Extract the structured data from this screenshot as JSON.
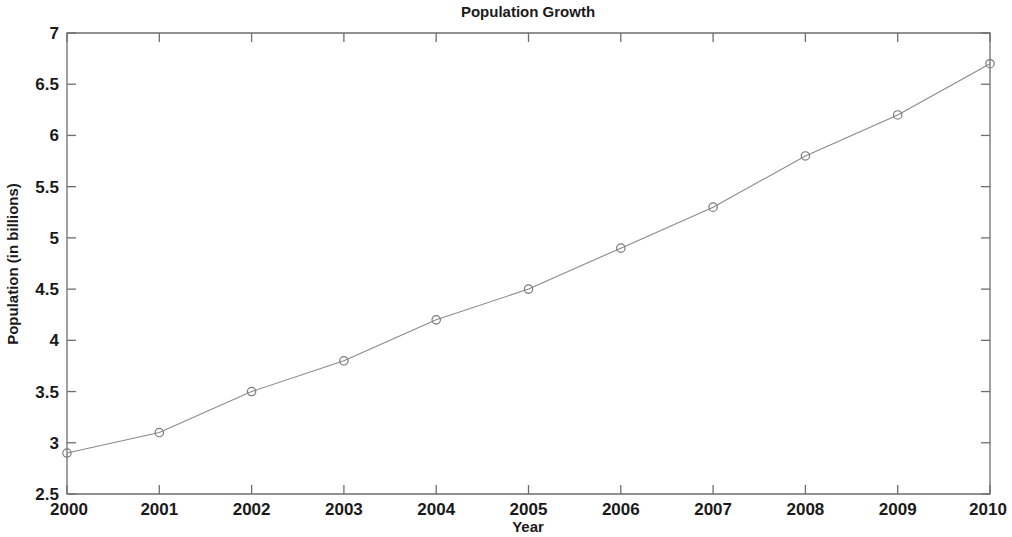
{
  "chart_data": {
    "type": "line",
    "title": "Population Growth",
    "xlabel": "Year",
    "ylabel": "Population (in billions)",
    "x": [
      2000,
      2001,
      2002,
      2003,
      2004,
      2005,
      2006,
      2007,
      2008,
      2009,
      2010
    ],
    "values": [
      2.9,
      3.1,
      3.5,
      3.8,
      4.2,
      4.5,
      4.9,
      5.3,
      5.8,
      6.2,
      6.7
    ],
    "xtick_labels": [
      "2000",
      "2001",
      "2002",
      "2003",
      "2004",
      "2005",
      "2006",
      "2007",
      "2008",
      "2009",
      "2010"
    ],
    "ytick_labels": [
      "2.5",
      "3",
      "3.5",
      "4",
      "4.5",
      "5",
      "5.5",
      "6",
      "6.5",
      "7"
    ],
    "yticks": [
      2.5,
      3,
      3.5,
      4,
      4.5,
      5,
      5.5,
      6,
      6.5,
      7
    ],
    "xlim": [
      2000,
      2010
    ],
    "ylim": [
      2.5,
      7
    ],
    "grid": false,
    "legend": null,
    "marker": "open-circle",
    "line_color": "#8a8a8a",
    "marker_color": "#7a7a7a",
    "axis_color": "#6e6e6e",
    "text_color": "#1a1a1a",
    "background": "#ffffff"
  }
}
